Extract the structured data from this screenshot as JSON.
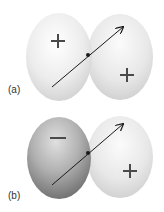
{
  "panels": [
    {
      "label": "(a)",
      "left_lobe": {
        "sign": "+",
        "shade": "light"
      },
      "right_lobe": {
        "sign": "+",
        "shade": "light"
      }
    },
    {
      "label": "(b)",
      "left_lobe": {
        "sign": "−",
        "shade": "dark"
      },
      "right_lobe": {
        "sign": "+",
        "shade": "light"
      }
    }
  ],
  "colors": {
    "light_lobe_center": "#ffffff",
    "light_lobe_edge": "#d4d4d4",
    "dark_lobe_center": "#d8d8d8",
    "dark_lobe_edge": "#6e6e6e",
    "sign": "#4a4a4a",
    "arrow": "#1a1a1a"
  }
}
